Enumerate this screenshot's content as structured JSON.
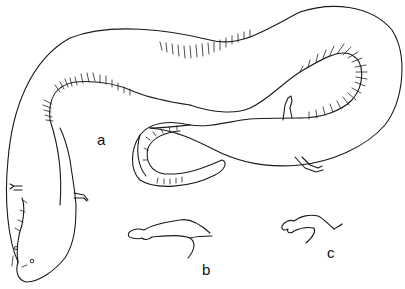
{
  "figure": {
    "labels": {
      "a": "a",
      "b": "b",
      "c": "c"
    },
    "parts": [
      {
        "id": "a",
        "description": "whole animal, elongate body with costal grooves, tiny limbs"
      },
      {
        "id": "b",
        "description": "forelimb detail"
      },
      {
        "id": "c",
        "description": "hindlimb detail"
      }
    ],
    "colors": {
      "ink": "#1a1a1a",
      "background": "#ffffff"
    }
  }
}
